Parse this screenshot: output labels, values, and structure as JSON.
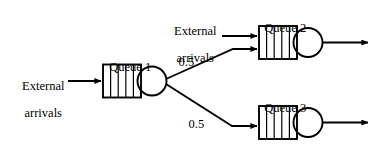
{
  "diagram": {
    "type": "queueing-network",
    "title": "",
    "background_color": "#ffffff",
    "stroke_color": "#000000",
    "labels": {
      "queue1": "Queue 1",
      "queue2": "Queue 2",
      "queue3": "Queue 3",
      "external_arrivals_left_line1": "External",
      "external_arrivals_left_line2": "arrivals",
      "external_arrivals_top_line1": "External",
      "external_arrivals_top_line2": "arrivals",
      "branch_prob_upper": "0.5",
      "branch_prob_lower": "0.5"
    },
    "nodes": [
      {
        "id": "queue1",
        "label": "Queue 1",
        "buffer_slots": 5,
        "server": "circle"
      },
      {
        "id": "queue2",
        "label": "Queue 2",
        "buffer_slots": 5,
        "server": "circle"
      },
      {
        "id": "queue3",
        "label": "Queue 3",
        "buffer_slots": 5,
        "server": "circle"
      }
    ],
    "edges": [
      {
        "id": "ext-to-q1",
        "from": "external",
        "to": "queue1",
        "label": ""
      },
      {
        "id": "ext-to-q2",
        "from": "external",
        "to": "queue2",
        "label": ""
      },
      {
        "id": "q1-to-q2",
        "from": "queue1",
        "to": "queue2",
        "label": "0.5"
      },
      {
        "id": "q1-to-q3",
        "from": "queue1",
        "to": "queue3",
        "label": "0.5"
      },
      {
        "id": "q2-out",
        "from": "queue2",
        "to": "departure",
        "label": ""
      },
      {
        "id": "q3-out",
        "from": "queue3",
        "to": "departure",
        "label": ""
      }
    ]
  }
}
